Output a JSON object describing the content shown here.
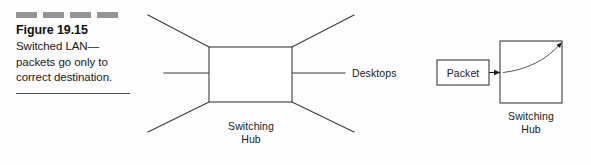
{
  "figure": {
    "number_label": "Figure 19.15",
    "caption_lines": [
      "Switched LAN—",
      "packets go only to",
      "correct destination."
    ],
    "rule_dash_count": 4,
    "dash_color": "#949494",
    "rule_color": "#4a4a4a"
  },
  "center_diagram": {
    "hub_label_line1": "Switching",
    "hub_label_line2": "Hub",
    "desktops_label": "Desktops",
    "line_color": "#3c3c3c",
    "box_fill": "#ffffff"
  },
  "right_diagram": {
    "packet_label": "Packet",
    "hub_label_line1": "Switching",
    "hub_label_line2": "Hub",
    "line_color": "#3c3c3c",
    "box_fill": "#ffffff"
  },
  "page": {
    "background": "#fdfdfd"
  }
}
